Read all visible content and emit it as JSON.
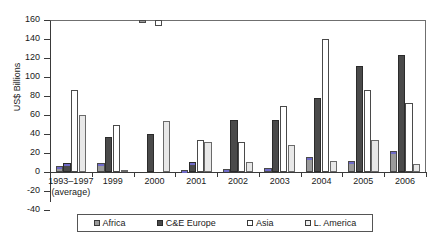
{
  "chart_data": {
    "type": "bar",
    "title": "",
    "subtitle": "",
    "xlabel": "",
    "ylabel": "US$ Billions",
    "ylim": [
      -40,
      160
    ],
    "ytick_step": 20,
    "yticks": [
      160,
      140,
      120,
      100,
      80,
      60,
      40,
      20,
      0,
      -20,
      -40
    ],
    "ytick_labels": [
      "160",
      "140",
      "120",
      "100",
      "80",
      "60",
      "40",
      "20",
      "0",
      "-20",
      "-40"
    ],
    "grid": false,
    "legend_position": "bottom",
    "categories": [
      "1993–1997\n(average)",
      "1999",
      "2000",
      "2001",
      "2002",
      "2003",
      "2004",
      "2005",
      "2006"
    ],
    "category_labels": [
      {
        "line1": "1993–1997",
        "line2": "(average)"
      },
      {
        "line1": "1999",
        "line2": ""
      },
      {
        "line1": "2000",
        "line2": ""
      },
      {
        "line1": "2001",
        "line2": ""
      },
      {
        "line1": "2002",
        "line2": ""
      },
      {
        "line1": "2003",
        "line2": ""
      },
      {
        "line1": "2004",
        "line2": ""
      },
      {
        "line1": "2005",
        "line2": ""
      },
      {
        "line1": "2006",
        "line2": ""
      }
    ],
    "series": [
      {
        "name": "Africa",
        "color": "#9a9a9a",
        "values": [
          6,
          9,
          -3,
          2,
          3,
          4,
          16,
          12,
          22
        ]
      },
      {
        "name": "C&E Europe",
        "color": "#4a4a4a",
        "values": [
          9,
          37,
          40,
          11,
          55,
          55,
          78,
          112,
          123
        ]
      },
      {
        "name": "Asia",
        "color": "#ffffff",
        "values": [
          86,
          49,
          -6,
          34,
          32,
          70,
          140,
          86,
          73
        ]
      },
      {
        "name": "L. America",
        "color": "#e8e8e8",
        "values": [
          60,
          1,
          54,
          32,
          11,
          28,
          12,
          34,
          8
        ]
      }
    ]
  },
  "legend": {
    "items": [
      {
        "label": "Africa",
        "swatch": "swatch-africa"
      },
      {
        "label": "C&E Europe",
        "swatch": "swatch-cee-europe"
      },
      {
        "label": "Asia",
        "swatch": "swatch-asia"
      },
      {
        "label": "L. America",
        "swatch": "swatch-l-america"
      }
    ]
  }
}
